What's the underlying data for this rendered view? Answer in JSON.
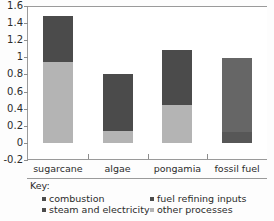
{
  "chart_data": {
    "type": "bar",
    "subtype": "stacked-bar",
    "title": "",
    "xlabel": "",
    "ylabel": "",
    "categories": [
      "sugarcane",
      "algae",
      "pongamia",
      "fossil fuel"
    ],
    "ylim": [
      -0.2,
      1.6
    ],
    "yticks": [
      1.6,
      1.4,
      1.2,
      1.0,
      0.8,
      0.6,
      0.4,
      0.2,
      0.0,
      -0.2
    ],
    "ytick_labels": [
      "1.6",
      "1.4",
      "1.2",
      "1",
      "0.8",
      "0.6",
      "0.4",
      "0.2",
      "0",
      "-0.2"
    ],
    "grid": false,
    "legend_position": "below",
    "series": [
      {
        "name": "combustion",
        "color": "#4b4b4b",
        "values": [
          0,
          0,
          0,
          0
        ]
      },
      {
        "name": "fuel refining inputs",
        "color": "#4b4b4b",
        "values": [
          0,
          0,
          0,
          0.13
        ]
      },
      {
        "name": "steam and electricity",
        "color": "#4b4b4b",
        "values": [
          0.54,
          0.66,
          0.64,
          0.86
        ]
      },
      {
        "name": "other processes",
        "color": "#b4b4b4",
        "values": [
          0.94,
          0.14,
          0.44,
          0
        ]
      }
    ],
    "totals": [
      1.48,
      0.8,
      1.08,
      0.99
    ],
    "bars": [
      {
        "category": "sugarcane",
        "total": 1.48,
        "segments": [
          {
            "name": "other processes",
            "from": 0,
            "to": 0.94,
            "color": "#b4b4b4"
          },
          {
            "name": "steam and electricity",
            "from": 0.94,
            "to": 1.48,
            "color": "#4b4b4b"
          }
        ]
      },
      {
        "category": "algae",
        "total": 0.8,
        "segments": [
          {
            "name": "other processes",
            "from": 0,
            "to": 0.14,
            "color": "#b4b4b4"
          },
          {
            "name": "steam and electricity",
            "from": 0.14,
            "to": 0.8,
            "color": "#4b4b4b"
          }
        ]
      },
      {
        "category": "pongamia",
        "total": 1.08,
        "segments": [
          {
            "name": "other processes",
            "from": 0,
            "to": 0.44,
            "color": "#b4b4b4"
          },
          {
            "name": "steam and electricity",
            "from": 0.44,
            "to": 1.08,
            "color": "#4b4b4b"
          }
        ]
      },
      {
        "category": "fossil fuel",
        "total": 0.99,
        "segments": [
          {
            "name": "fuel refining inputs",
            "from": 0,
            "to": 0.13,
            "color": "#575757"
          },
          {
            "name": "combustion",
            "from": 0.13,
            "to": 0.99,
            "color": "#666666"
          }
        ]
      }
    ]
  },
  "legend": {
    "title": "Key:",
    "entries": [
      {
        "label": "combustion",
        "color": "#4b4b4b"
      },
      {
        "label": "fuel refining inputs",
        "color": "#4b4b4b"
      },
      {
        "label": "steam and electricity",
        "color": "#4b4b4b"
      },
      {
        "label": "other processes",
        "color": "#b4b4b4"
      }
    ]
  }
}
